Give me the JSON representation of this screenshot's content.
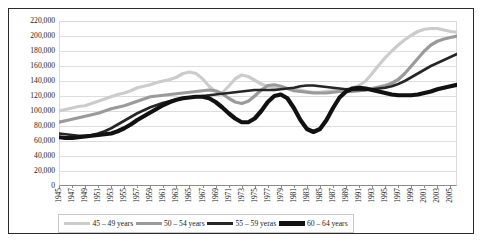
{
  "chart_data": {
    "type": "line",
    "title": "",
    "xlabel": "",
    "ylabel": "",
    "ylim": [
      0,
      220000
    ],
    "grid": true,
    "legend_position": "bottom",
    "y_ticks": [
      "0",
      "20,000",
      "40,000",
      "60,000",
      "80,000",
      "100,000",
      "120,000",
      "140,000",
      "160,000",
      "180,000",
      "200,000",
      "220,000"
    ],
    "y_tick_values": [
      0,
      20000,
      40000,
      60000,
      80000,
      100000,
      120000,
      140000,
      160000,
      180000,
      200000,
      220000
    ],
    "x_tick_labels": [
      "1945",
      "1947",
      "1949",
      "1951",
      "1953",
      "1955",
      "1957",
      "1959",
      "1961",
      "1963",
      "1965",
      "1967",
      "1969",
      "1971",
      "1973",
      "1975",
      "1977",
      "1979",
      "1981",
      "1983",
      "1985",
      "1987",
      "1989",
      "1991",
      "1993",
      "1995",
      "1997",
      "1999",
      "2001",
      "2003",
      "2005"
    ],
    "x": [
      1945,
      1946,
      1947,
      1948,
      1949,
      1950,
      1951,
      1952,
      1953,
      1954,
      1955,
      1956,
      1957,
      1958,
      1959,
      1960,
      1961,
      1962,
      1963,
      1964,
      1965,
      1966,
      1967,
      1968,
      1969,
      1970,
      1971,
      1972,
      1973,
      1974,
      1975,
      1976,
      1977,
      1978,
      1979,
      1980,
      1981,
      1982,
      1983,
      1984,
      1985,
      1986,
      1987,
      1988,
      1989,
      1990,
      1991,
      1992,
      1993,
      1994,
      1995,
      1996,
      1997,
      1998,
      1999,
      2000,
      2001,
      2002,
      2003,
      2004,
      2005,
      2006
    ],
    "xlim": [
      1945,
      2006
    ],
    "series": [
      {
        "name": "45 – 49 years",
        "color": "#cccccc",
        "width": 3.2,
        "values": [
          100000,
          102000,
          104000,
          106000,
          107000,
          110000,
          113000,
          116000,
          119000,
          122000,
          124000,
          127000,
          131000,
          133000,
          135000,
          138000,
          140000,
          142000,
          145000,
          150000,
          152000,
          150000,
          143000,
          133000,
          126000,
          124000,
          133000,
          143000,
          148000,
          146000,
          141000,
          136000,
          133000,
          131000,
          130000,
          130000,
          130000,
          128000,
          126000,
          125000,
          125000,
          126000,
          127000,
          128000,
          129000,
          131000,
          134000,
          140000,
          150000,
          161000,
          171000,
          180000,
          188000,
          195000,
          201000,
          206000,
          209000,
          210000,
          210000,
          208000,
          206000,
          205000
        ]
      },
      {
        "name": "50 – 54 years",
        "color": "#9a9a9a",
        "width": 3.2,
        "values": [
          85000,
          87000,
          89000,
          91000,
          93000,
          95000,
          97000,
          100000,
          103000,
          105000,
          107000,
          110000,
          113000,
          116000,
          119000,
          120000,
          121000,
          122000,
          123000,
          124000,
          125000,
          126000,
          127000,
          128000,
          127000,
          123000,
          117000,
          112000,
          110000,
          113000,
          120000,
          128000,
          134000,
          135000,
          133000,
          130000,
          127000,
          126000,
          125000,
          124000,
          124000,
          124000,
          125000,
          126000,
          126000,
          126000,
          127000,
          128000,
          130000,
          132000,
          134000,
          137000,
          142000,
          150000,
          160000,
          170000,
          180000,
          188000,
          193000,
          196000,
          198000,
          200000
        ]
      },
      {
        "name": "55 – 59 yeras",
        "color": "#262626",
        "width": 2.6,
        "values": [
          70000,
          69000,
          68000,
          67000,
          67000,
          68000,
          70000,
          73000,
          77000,
          82000,
          87000,
          92000,
          97000,
          101000,
          105000,
          108000,
          111000,
          113000,
          115000,
          117000,
          118000,
          119000,
          120000,
          121000,
          122000,
          123000,
          124000,
          125000,
          126000,
          127000,
          128000,
          128000,
          128000,
          128000,
          129000,
          130000,
          131000,
          133000,
          134000,
          134000,
          133000,
          132000,
          131000,
          130000,
          129000,
          128000,
          128000,
          128000,
          129000,
          130000,
          131000,
          133000,
          136000,
          140000,
          145000,
          150000,
          155000,
          160000,
          164000,
          168000,
          172000,
          176000
        ]
      },
      {
        "name": "60 – 64 years",
        "color": "#111111",
        "width": 4.2,
        "values": [
          65000,
          64000,
          64000,
          65000,
          66000,
          67000,
          68000,
          69000,
          70000,
          73000,
          77000,
          82000,
          88000,
          93000,
          98000,
          103000,
          108000,
          112000,
          115000,
          117000,
          118000,
          119000,
          119000,
          117000,
          112000,
          105000,
          97000,
          90000,
          85000,
          85000,
          90000,
          100000,
          112000,
          120000,
          122000,
          117000,
          104000,
          88000,
          76000,
          72000,
          76000,
          88000,
          104000,
          118000,
          126000,
          130000,
          131000,
          130000,
          128000,
          126000,
          124000,
          122000,
          121000,
          121000,
          121000,
          122000,
          124000,
          126000,
          129000,
          131000,
          133000,
          135000
        ]
      }
    ]
  },
  "legend": {
    "items": [
      {
        "label": "45 – 49 years"
      },
      {
        "label": "50 – 54 years"
      },
      {
        "label": "55 – 59 yeras"
      },
      {
        "label": "60 – 64 years"
      }
    ]
  }
}
